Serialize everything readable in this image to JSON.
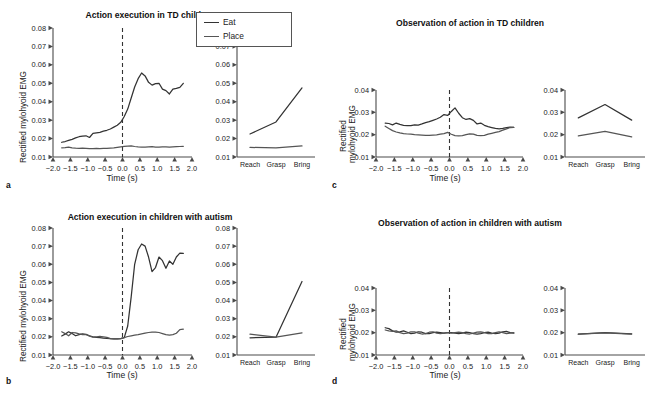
{
  "figure": {
    "legend": {
      "items": [
        {
          "label": "Eat",
          "color": "#333333",
          "icon": "line-swatch"
        },
        {
          "label": "Place",
          "color": "#555555",
          "icon": "line-swatch"
        }
      ]
    },
    "axis_titles": {
      "y": "Rectified mylohyoid EMG",
      "y_line1": "Rectified",
      "y_line2": "mylohyoid EMG",
      "x": "Time (s)"
    },
    "panels": [
      {
        "letter": "a",
        "title": "Action execution in TD children",
        "ylabel": "Rectified mylohyoid EMG",
        "xlabel": "Time (s)",
        "yticks": [
          "0.08",
          "0.07",
          "0.06",
          "0.05",
          "0.04",
          "0.03",
          "0.02",
          "0.01"
        ],
        "xticks": [
          "-2.0",
          "-1.5",
          "-1.0",
          "-0.5",
          "0.0",
          "0.5",
          "1.0",
          "1.5",
          "2.0"
        ],
        "categories": [
          "Reach",
          "Grasp",
          "Bring"
        ],
        "cat_yticks": [
          "0.08",
          "0.07",
          "0.06",
          "0.05",
          "0.04",
          "0.03",
          "0.02",
          "0.01"
        ]
      },
      {
        "letter": "b",
        "title": "Action execution in children with autism",
        "ylabel": "Rectified mylohyoid EMG",
        "xlabel": "Time (s)",
        "yticks": [
          "0.08",
          "0.07",
          "0.06",
          "0.05",
          "0.04",
          "0.03",
          "0.02",
          "0.01"
        ],
        "xticks": [
          "-2.0",
          "-1.5",
          "-1.0",
          "-0.5",
          "0.0",
          "0.5",
          "1.0",
          "1.5",
          "2.0"
        ],
        "categories": [
          "Reach",
          "Grasp",
          "Bring"
        ],
        "cat_yticks": [
          "0.08",
          "0.07",
          "0.06",
          "0.05",
          "0.04",
          "0.03",
          "0.02",
          "0.01"
        ]
      },
      {
        "letter": "c",
        "title": "Observation of action in TD children",
        "ylabel_line1": "Rectified",
        "ylabel_line2": "mylohyoid EMG",
        "xlabel": "Time (s)",
        "yticks": [
          "0.04",
          "0.03",
          "0.02",
          "0.01"
        ],
        "xticks": [
          "-2.0",
          "-1.5",
          "-1.0",
          "-0.5",
          "0.0",
          "0.5",
          "1.0",
          "1.5",
          "2.0"
        ],
        "categories": [
          "Reach",
          "Grasp",
          "Bring"
        ],
        "cat_yticks": [
          "0.04",
          "0.03",
          "0.02",
          "0.01"
        ]
      },
      {
        "letter": "d",
        "title": "Observation of action in children with autism",
        "ylabel_line1": "Rectified",
        "ylabel_line2": "mylohyoid EMG",
        "xlabel": "Time (s)",
        "yticks": [
          "0.04",
          "0.03",
          "0.02",
          "0.01"
        ],
        "xticks": [
          "-2.0",
          "-1.5",
          "-1.0",
          "-0.5",
          "0.0",
          "0.5",
          "1.0",
          "1.5",
          "2.0"
        ],
        "categories": [
          "Reach",
          "Grasp",
          "Bring"
        ],
        "cat_yticks": [
          "0.04",
          "0.03",
          "0.02",
          "0.01"
        ]
      }
    ]
  },
  "chart_data": [
    {
      "id": "a-timeseries",
      "type": "line",
      "title": "Action execution in TD children",
      "xlabel": "Time (s)",
      "ylabel": "Rectified mylohyoid EMG",
      "xlim": [
        -2.0,
        2.0
      ],
      "ylim": [
        0.01,
        0.08
      ],
      "grid": false,
      "legend_position": "figure-top-center",
      "annotations": [
        {
          "type": "vline",
          "x": 0.0,
          "style": "dashed"
        }
      ],
      "x": [
        -1.75,
        -1.65,
        -1.55,
        -1.45,
        -1.35,
        -1.25,
        -1.15,
        -1.05,
        -0.95,
        -0.85,
        -0.75,
        -0.65,
        -0.55,
        -0.45,
        -0.35,
        -0.25,
        -0.15,
        -0.05,
        0.05,
        0.15,
        0.25,
        0.35,
        0.45,
        0.55,
        0.65,
        0.75,
        0.85,
        0.95,
        1.05,
        1.15,
        1.25,
        1.35,
        1.45,
        1.55,
        1.65,
        1.75
      ],
      "series": [
        {
          "name": "Eat",
          "color": "#333333",
          "values": [
            0.018,
            0.0184,
            0.019,
            0.0196,
            0.0204,
            0.021,
            0.0213,
            0.0215,
            0.0206,
            0.0228,
            0.0231,
            0.0234,
            0.024,
            0.0245,
            0.0252,
            0.0262,
            0.0272,
            0.0288,
            0.032,
            0.036,
            0.042,
            0.048,
            0.0525,
            0.0556,
            0.054,
            0.0505,
            0.049,
            0.0498,
            0.05,
            0.0468,
            0.046,
            0.0442,
            0.0468,
            0.0472,
            0.0478,
            0.05
          ]
        },
        {
          "name": "Place",
          "color": "#555555",
          "values": [
            0.015,
            0.0151,
            0.0153,
            0.015,
            0.0148,
            0.0147,
            0.0148,
            0.0147,
            0.0146,
            0.0146,
            0.0147,
            0.0146,
            0.0147,
            0.0147,
            0.0148,
            0.0149,
            0.0152,
            0.0155,
            0.0158,
            0.0159,
            0.016,
            0.0157,
            0.0155,
            0.0154,
            0.0153,
            0.0155,
            0.0156,
            0.0154,
            0.0153,
            0.0155,
            0.0155,
            0.0154,
            0.0155,
            0.0156,
            0.0157,
            0.0158
          ]
        }
      ]
    },
    {
      "id": "a-categories",
      "type": "line",
      "categories": [
        "Reach",
        "Grasp",
        "Bring"
      ],
      "ylim": [
        0.01,
        0.08
      ],
      "ylabel": "Rectified mylohyoid EMG",
      "series": [
        {
          "name": "Eat",
          "color": "#333333",
          "values": [
            0.0225,
            0.029,
            0.0475
          ]
        },
        {
          "name": "Place",
          "color": "#555555",
          "values": [
            0.0152,
            0.015,
            0.016
          ]
        }
      ]
    },
    {
      "id": "b-timeseries",
      "type": "line",
      "title": "Action execution in children with autism",
      "xlabel": "Time (s)",
      "ylabel": "Rectified mylohyoid EMG",
      "xlim": [
        -2.0,
        2.0
      ],
      "ylim": [
        0.01,
        0.08
      ],
      "grid": false,
      "annotations": [
        {
          "type": "vline",
          "x": 0.0,
          "style": "dashed"
        }
      ],
      "x": [
        -1.75,
        -1.65,
        -1.55,
        -1.45,
        -1.35,
        -1.25,
        -1.15,
        -1.05,
        -0.95,
        -0.85,
        -0.75,
        -0.65,
        -0.55,
        -0.45,
        -0.35,
        -0.25,
        -0.15,
        -0.05,
        0.05,
        0.15,
        0.25,
        0.35,
        0.45,
        0.55,
        0.65,
        0.75,
        0.85,
        0.95,
        1.05,
        1.15,
        1.25,
        1.35,
        1.45,
        1.55,
        1.65,
        1.75
      ],
      "series": [
        {
          "name": "Eat",
          "color": "#333333",
          "values": [
            0.0205,
            0.0215,
            0.0228,
            0.0218,
            0.0206,
            0.0212,
            0.0216,
            0.0214,
            0.0206,
            0.02,
            0.0197,
            0.0196,
            0.0193,
            0.0192,
            0.019,
            0.0189,
            0.0189,
            0.019,
            0.0196,
            0.026,
            0.042,
            0.06,
            0.068,
            0.0712,
            0.07,
            0.064,
            0.056,
            0.0582,
            0.064,
            0.062,
            0.0578,
            0.0618,
            0.06,
            0.064,
            0.0662,
            0.066
          ]
        },
        {
          "name": "Place",
          "color": "#555555",
          "values": [
            0.0228,
            0.0218,
            0.0206,
            0.0224,
            0.0222,
            0.0216,
            0.0212,
            0.0213,
            0.0204,
            0.0198,
            0.02,
            0.0202,
            0.02,
            0.0197,
            0.019,
            0.0189,
            0.0189,
            0.019,
            0.0196,
            0.0202,
            0.0206,
            0.021,
            0.0212,
            0.0216,
            0.022,
            0.0224,
            0.0226,
            0.0226,
            0.0224,
            0.0218,
            0.0212,
            0.021,
            0.0212,
            0.022,
            0.024,
            0.0242
          ]
        }
      ]
    },
    {
      "id": "b-categories",
      "type": "line",
      "categories": [
        "Reach",
        "Grasp",
        "Bring"
      ],
      "ylim": [
        0.01,
        0.08
      ],
      "series": [
        {
          "name": "Eat",
          "color": "#333333",
          "values": [
            0.0195,
            0.0198,
            0.0505
          ]
        },
        {
          "name": "Place",
          "color": "#555555",
          "values": [
            0.0215,
            0.0198,
            0.0222
          ]
        }
      ]
    },
    {
      "id": "c-timeseries",
      "type": "line",
      "title": "Observation of action in TD children",
      "xlabel": "Time (s)",
      "ylabel": "Rectified mylohyoid EMG",
      "xlim": [
        -2.0,
        2.0
      ],
      "ylim": [
        0.01,
        0.04
      ],
      "grid": false,
      "annotations": [
        {
          "type": "vline",
          "x": 0.0,
          "style": "dashed"
        }
      ],
      "x": [
        -1.75,
        -1.65,
        -1.55,
        -1.45,
        -1.35,
        -1.25,
        -1.15,
        -1.05,
        -0.95,
        -0.85,
        -0.75,
        -0.65,
        -0.55,
        -0.45,
        -0.35,
        -0.25,
        -0.15,
        -0.05,
        0.05,
        0.15,
        0.25,
        0.35,
        0.45,
        0.55,
        0.65,
        0.75,
        0.85,
        0.95,
        1.05,
        1.15,
        1.25,
        1.35,
        1.45,
        1.55,
        1.65,
        1.75
      ],
      "series": [
        {
          "name": "Eat",
          "color": "#333333",
          "values": [
            0.0252,
            0.025,
            0.0244,
            0.0252,
            0.0246,
            0.0242,
            0.024,
            0.024,
            0.0244,
            0.0243,
            0.0248,
            0.0254,
            0.0258,
            0.0264,
            0.027,
            0.0278,
            0.029,
            0.0286,
            0.0304,
            0.032,
            0.0296,
            0.0276,
            0.0268,
            0.0272,
            0.0264,
            0.0248,
            0.0252,
            0.0242,
            0.0236,
            0.0232,
            0.0228,
            0.0226,
            0.0228,
            0.0232,
            0.0234,
            0.0233
          ]
        },
        {
          "name": "Place",
          "color": "#555555",
          "values": [
            0.0238,
            0.0228,
            0.0218,
            0.0212,
            0.0208,
            0.0205,
            0.0203,
            0.0202,
            0.02,
            0.0199,
            0.0198,
            0.0197,
            0.0197,
            0.0198,
            0.0199,
            0.0202,
            0.0205,
            0.021,
            0.0202,
            0.0196,
            0.0195,
            0.0196,
            0.02,
            0.0204,
            0.0202,
            0.0197,
            0.0196,
            0.0197,
            0.0202,
            0.0206,
            0.021,
            0.0214,
            0.022,
            0.0226,
            0.0232,
            0.0233
          ]
        }
      ]
    },
    {
      "id": "c-categories",
      "type": "line",
      "categories": [
        "Reach",
        "Grasp",
        "Bring"
      ],
      "ylim": [
        0.01,
        0.04
      ],
      "series": [
        {
          "name": "Eat",
          "color": "#333333",
          "values": [
            0.0275,
            0.0335,
            0.0265
          ]
        },
        {
          "name": "Place",
          "color": "#555555",
          "values": [
            0.0195,
            0.0215,
            0.019
          ]
        }
      ]
    },
    {
      "id": "d-timeseries",
      "type": "line",
      "title": "Observation of action in children with autism",
      "xlabel": "Time (s)",
      "ylabel": "Rectified mylohyoid EMG",
      "xlim": [
        -2.0,
        2.0
      ],
      "ylim": [
        0.01,
        0.04
      ],
      "grid": false,
      "annotations": [
        {
          "type": "vline",
          "x": 0.0,
          "style": "dashed"
        }
      ],
      "x": [
        -1.75,
        -1.65,
        -1.55,
        -1.45,
        -1.35,
        -1.25,
        -1.15,
        -1.05,
        -0.95,
        -0.85,
        -0.75,
        -0.65,
        -0.55,
        -0.45,
        -0.35,
        -0.25,
        -0.15,
        -0.05,
        0.05,
        0.15,
        0.25,
        0.35,
        0.45,
        0.55,
        0.65,
        0.75,
        0.85,
        0.95,
        1.05,
        1.15,
        1.25,
        1.35,
        1.45,
        1.55,
        1.65,
        1.75
      ],
      "series": [
        {
          "name": "Eat",
          "color": "#333333",
          "values": [
            0.0222,
            0.0218,
            0.0208,
            0.0202,
            0.0204,
            0.0208,
            0.0202,
            0.0196,
            0.0198,
            0.0204,
            0.0202,
            0.0196,
            0.0196,
            0.02,
            0.0202,
            0.02,
            0.0198,
            0.02,
            0.02,
            0.0198,
            0.0196,
            0.0198,
            0.0202,
            0.02,
            0.0196,
            0.0194,
            0.0196,
            0.02,
            0.0202,
            0.0198,
            0.0196,
            0.0198,
            0.0204,
            0.0206,
            0.02,
            0.0198
          ]
        },
        {
          "name": "Place",
          "color": "#555555",
          "values": [
            0.0212,
            0.0208,
            0.0206,
            0.0208,
            0.02,
            0.0196,
            0.0198,
            0.0204,
            0.0204,
            0.0198,
            0.0194,
            0.0196,
            0.0202,
            0.0204,
            0.0198,
            0.0196,
            0.0198,
            0.02,
            0.0198,
            0.02,
            0.0202,
            0.02,
            0.0196,
            0.0194,
            0.0198,
            0.0202,
            0.0204,
            0.02,
            0.0196,
            0.0196,
            0.02,
            0.0204,
            0.02,
            0.0196,
            0.0198,
            0.02
          ]
        }
      ]
    },
    {
      "id": "d-categories",
      "type": "line",
      "categories": [
        "Reach",
        "Grasp",
        "Bring"
      ],
      "ylim": [
        0.01,
        0.04
      ],
      "series": [
        {
          "name": "Eat",
          "color": "#333333",
          "values": [
            0.0193,
            0.02,
            0.0195
          ]
        },
        {
          "name": "Place",
          "color": "#555555",
          "values": [
            0.0193,
            0.0199,
            0.0194
          ]
        }
      ]
    }
  ]
}
